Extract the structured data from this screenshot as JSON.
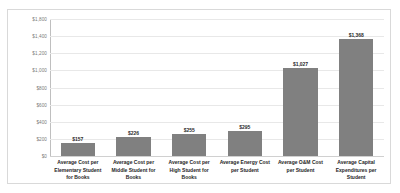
{
  "chart_data": {
    "type": "bar",
    "title": "",
    "xlabel": "",
    "ylabel": "",
    "ylim": [
      0,
      1600
    ],
    "grid": true,
    "legend": "none",
    "bar_color": "#808080",
    "categories": [
      "Average Cost per Elementary Student for Books",
      "Average Cost per Middle Student for Books",
      "Average Cost per High Student for Books",
      "Average Energy Cost per Student",
      "Average O&M Cost per Student",
      "Average Capital Expenditures per Student"
    ],
    "values": [
      157,
      226,
      255,
      295,
      1027,
      1368
    ],
    "data_labels": [
      "$157",
      "$226",
      "$255",
      "$295",
      "$1,027",
      "$1,368"
    ],
    "ytick_values": [
      1600,
      1400,
      1200,
      1000,
      800,
      600,
      400,
      200,
      0
    ],
    "ytick_labels": [
      "$1,800",
      "$1,400",
      "$1,200",
      "$1,000",
      "$800",
      "$600",
      "$400",
      "$200",
      "$0"
    ]
  }
}
